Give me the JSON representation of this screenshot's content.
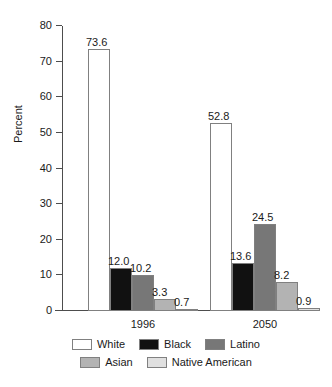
{
  "chart_data": {
    "type": "bar",
    "title": "",
    "xlabel": "",
    "ylabel": "Percent",
    "ylim": [
      0,
      80
    ],
    "ytick_step": 10,
    "grid": false,
    "legend_position": "bottom",
    "categories": [
      "1996",
      "2050"
    ],
    "ytick_labels": [
      "80",
      "70",
      "60",
      "50",
      "40",
      "30",
      "20",
      "10",
      "0"
    ],
    "series": [
      {
        "name": "White",
        "color": "#ffffff",
        "values": [
          73.6,
          52.8
        ],
        "labels": [
          "73.6",
          "52.8"
        ]
      },
      {
        "name": "Black",
        "color": "#111111",
        "values": [
          12.0,
          13.6
        ],
        "labels": [
          "12.0",
          "13.6"
        ]
      },
      {
        "name": "Latino",
        "color": "#777777",
        "values": [
          10.2,
          24.5
        ],
        "labels": [
          "10.2",
          "24.5"
        ]
      },
      {
        "name": "Asian",
        "color": "#b3b3b3",
        "values": [
          3.3,
          8.2
        ],
        "labels": [
          "3.3",
          "8.2"
        ]
      },
      {
        "name": "Native American",
        "color": "#e0e0e0",
        "values": [
          0.7,
          0.9
        ],
        "labels": [
          "0.7",
          "0.9"
        ]
      }
    ],
    "legend_rows": [
      [
        "White",
        "Black",
        "Latino"
      ],
      [
        "Asian",
        "Native American"
      ]
    ]
  },
  "axis": {
    "y_title": "Percent"
  },
  "colors": {
    "axis": "#4d4d4d",
    "bar_outline": "#808080",
    "text": "#1a1a1a",
    "background": "#ffffff"
  }
}
